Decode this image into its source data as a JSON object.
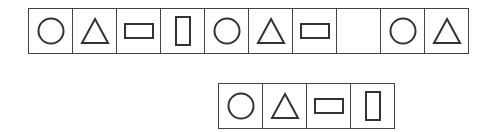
{
  "colors": {
    "stroke": "#333333",
    "border": "#444444",
    "background": "#ffffff"
  },
  "sequence": {
    "cells": [
      "circle",
      "triangle",
      "rectangle-horizontal",
      "rectangle-vertical",
      "circle",
      "triangle",
      "rectangle-horizontal",
      "blank",
      "circle",
      "triangle"
    ]
  },
  "options": {
    "cells": [
      "circle",
      "triangle",
      "rectangle-horizontal",
      "rectangle-vertical"
    ]
  }
}
